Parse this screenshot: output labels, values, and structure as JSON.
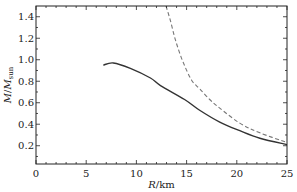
{
  "chart_data": {
    "type": "line",
    "title": "",
    "xlabel": "R/km",
    "ylabel": "M/M_sun",
    "xlim": [
      0,
      25
    ],
    "ylim": [
      0.03,
      1.5
    ],
    "grid": false,
    "legend": null,
    "x_ticks": [
      "0",
      "5",
      "10",
      "15",
      "20",
      "25"
    ],
    "y_ticks": [
      "0.2",
      "0.4",
      "0.6",
      "0.8",
      "1.0",
      "1.2",
      "1.4"
    ],
    "series": [
      {
        "name": "solid",
        "style": "solid",
        "color": "#333333",
        "x": [
          6.7,
          7.7,
          9.4,
          11.4,
          12.4,
          14.8,
          16.3,
          18.3,
          20.3,
          22.3,
          25.0
        ],
        "y": [
          0.95,
          0.97,
          0.92,
          0.83,
          0.76,
          0.63,
          0.53,
          0.42,
          0.34,
          0.27,
          0.21
        ]
      },
      {
        "name": "dashed",
        "style": "dashed",
        "color": "#777777",
        "x": [
          12.95,
          13.4,
          13.9,
          14.6,
          15.5,
          16.3,
          17.3,
          18.3,
          20.3,
          22.3,
          25.0
        ],
        "y": [
          1.5,
          1.36,
          1.18,
          0.99,
          0.81,
          0.73,
          0.63,
          0.55,
          0.41,
          0.32,
          0.23
        ]
      }
    ]
  }
}
